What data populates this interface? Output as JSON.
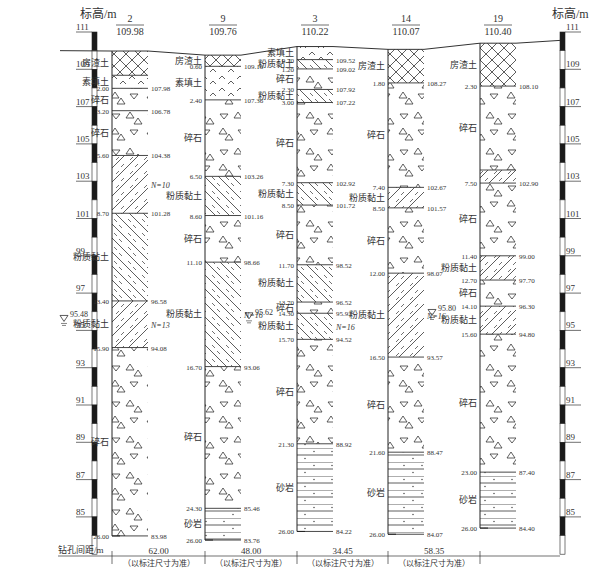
{
  "axis": {
    "title_left": "标高/m",
    "title_right": "标高/m",
    "ticks": [
      111,
      109,
      107,
      105,
      103,
      101,
      99,
      97,
      95,
      93,
      91,
      89,
      87,
      85
    ],
    "range": [
      83,
      111
    ]
  },
  "legend_colors": {
    "line": "#333333",
    "scale_dark": "#1a1a1a",
    "scale_light": "#ffffff"
  },
  "boreholes": [
    {
      "id": "2",
      "elevation": "109.98",
      "top": 109.98,
      "layers": [
        {
          "name": "房渣土",
          "pattern": "crosshatch",
          "from": 0,
          "to": 1.3
        },
        {
          "name": "素填土",
          "pattern": "fill",
          "from": 1.3,
          "to": 2.0,
          "depth_label": "2.00",
          "elev_label": "107.98"
        },
        {
          "name": "碎石",
          "pattern": "gravel",
          "from": 2.0,
          "to": 3.2,
          "depth_label": "3.20",
          "elev_label": "106.78"
        },
        {
          "name": "碎石",
          "pattern": "gravel",
          "from": 3.2,
          "to": 5.6,
          "depth_label": "5.60",
          "elev_label": "104.38"
        },
        {
          "name": "",
          "pattern": "silt-fwd",
          "from": 5.6,
          "to": 8.7,
          "depth_label": "8.70",
          "elev_label": "101.28",
          "note": "N=10"
        },
        {
          "name": "粉质黏土",
          "pattern": "silt-back",
          "from": 8.7,
          "to": 13.4,
          "depth_label": "13.40",
          "elev_label": "96.58"
        },
        {
          "name": "粉质黏土",
          "pattern": "silt-fwd",
          "from": 13.4,
          "to": 15.9,
          "depth_label": "15.90",
          "elev_label": "94.08",
          "note": "N=13"
        },
        {
          "name": "碎石",
          "pattern": "gravel",
          "from": 15.9,
          "to": 26.0,
          "depth_label": "26.00",
          "elev_label": "83.98"
        }
      ],
      "water": "95.48"
    },
    {
      "id": "9",
      "elevation": "109.76",
      "top": 109.76,
      "layers": [
        {
          "name": "房渣土",
          "pattern": "crosshatch",
          "from": 0,
          "to": 0.6,
          "depth_label": "0.60",
          "elev_label": "109.16"
        },
        {
          "name": "素填土",
          "pattern": "fill",
          "from": 0.6,
          "to": 2.4,
          "depth_label": "2.40",
          "elev_label": "107.36"
        },
        {
          "name": "碎石",
          "pattern": "gravel",
          "from": 2.4,
          "to": 6.5,
          "depth_label": "6.50",
          "elev_label": "103.26"
        },
        {
          "name": "粉质黏土",
          "pattern": "silt-back",
          "from": 6.5,
          "to": 8.6,
          "depth_label": "8.60",
          "elev_label": "101.16"
        },
        {
          "name": "碎石",
          "pattern": "gravel",
          "from": 8.6,
          "to": 11.1,
          "depth_label": "11.10",
          "elev_label": "98.66"
        },
        {
          "name": "粉质黏土",
          "pattern": "silt-back",
          "from": 11.1,
          "to": 16.7,
          "depth_label": "16.70",
          "elev_label": "93.06",
          "note": "N=16"
        },
        {
          "name": "碎石",
          "pattern": "gravel",
          "from": 16.7,
          "to": 24.3,
          "depth_label": "24.30",
          "elev_label": "85.46"
        },
        {
          "name": "砂岩",
          "pattern": "sandstone",
          "from": 24.3,
          "to": 26.0,
          "depth_label": "26.00",
          "elev_label": "83.76"
        }
      ],
      "water": "95.62"
    },
    {
      "id": "3",
      "elevation": "110.22",
      "top": 110.22,
      "layers": [
        {
          "name": "素填土",
          "pattern": "fill",
          "from": 0,
          "to": 0.7,
          "depth_label": "0.70",
          "elev_label": "109.52"
        },
        {
          "name": "粉质黏土",
          "pattern": "silt-back",
          "from": 0.7,
          "to": 1.2,
          "depth_label": "1.20",
          "elev_label": "109.02"
        },
        {
          "name": "碎石",
          "pattern": "gravel",
          "from": 1.2,
          "to": 2.3,
          "depth_label": "2.30",
          "elev_label": "107.92"
        },
        {
          "name": "粉质黏土",
          "pattern": "silt-back",
          "from": 2.3,
          "to": 3.0,
          "depth_label": "3.00",
          "elev_label": "107.22"
        },
        {
          "name": "碎石",
          "pattern": "gravel",
          "from": 3.0,
          "to": 7.3,
          "depth_label": "7.30",
          "elev_label": "102.92"
        },
        {
          "name": "粉质黏土",
          "pattern": "silt-back",
          "from": 7.3,
          "to": 8.5,
          "depth_label": "8.50",
          "elev_label": "101.72"
        },
        {
          "name": "碎石",
          "pattern": "gravel",
          "from": 8.5,
          "to": 11.7,
          "depth_label": "11.70",
          "elev_label": "98.52"
        },
        {
          "name": "粉质黏土",
          "pattern": "silt-back",
          "from": 11.7,
          "to": 13.7,
          "depth_label": "13.70",
          "elev_label": "96.52"
        },
        {
          "name": "碎石",
          "pattern": "gravel",
          "from": 13.7,
          "to": 14.3,
          "depth_label": "14.30",
          "elev_label": "95.92"
        },
        {
          "name": "粉质黏土",
          "pattern": "silt-back",
          "from": 14.3,
          "to": 15.7,
          "depth_label": "15.70",
          "elev_label": "94.52",
          "note": "N=16"
        },
        {
          "name": "碎石",
          "pattern": "gravel",
          "from": 15.7,
          "to": 21.3,
          "depth_label": "21.30",
          "elev_label": "88.92"
        },
        {
          "name": "砂岩",
          "pattern": "sandstone",
          "from": 21.3,
          "to": 26.0,
          "depth_label": "26.00",
          "elev_label": "84.22"
        }
      ],
      "water": ""
    },
    {
      "id": "14",
      "elevation": "110.07",
      "top": 110.07,
      "layers": [
        {
          "name": "房渣土",
          "pattern": "crosshatch",
          "from": 0,
          "to": 1.8,
          "depth_label": "1.80",
          "elev_label": "108.27"
        },
        {
          "name": "碎石",
          "pattern": "gravel",
          "from": 1.8,
          "to": 7.4,
          "depth_label": "7.40",
          "elev_label": "102.67"
        },
        {
          "name": "粉质黏土",
          "pattern": "silt-fwd",
          "from": 7.4,
          "to": 8.5,
          "depth_label": "8.50",
          "elev_label": "101.57"
        },
        {
          "name": "碎石",
          "pattern": "gravel",
          "from": 8.5,
          "to": 12.0,
          "depth_label": "12.00",
          "elev_label": "98.07"
        },
        {
          "name": "粉质黏土",
          "pattern": "silt-fwd",
          "from": 12.0,
          "to": 16.5,
          "depth_label": "16.50",
          "elev_label": "93.57",
          "note": "N=16"
        },
        {
          "name": "碎石",
          "pattern": "gravel",
          "from": 16.5,
          "to": 21.6,
          "depth_label": "21.60",
          "elev_label": "88.47"
        },
        {
          "name": "砂岩",
          "pattern": "sandstone",
          "from": 21.6,
          "to": 26.0,
          "depth_label": "26.00",
          "elev_label": "84.07"
        }
      ],
      "water": "95.80"
    },
    {
      "id": "19",
      "elevation": "110.40",
      "top": 110.4,
      "layers": [
        {
          "name": "房渣土",
          "pattern": "crosshatch",
          "from": 0,
          "to": 2.3,
          "depth_label": "2.30",
          "elev_label": "108.10"
        },
        {
          "name": "碎石",
          "pattern": "gravel",
          "from": 2.3,
          "to": 6.8
        },
        {
          "name": "",
          "pattern": "silt-fwd",
          "from": 6.8,
          "to": 7.5,
          "depth_label": "7.50",
          "elev_label": "102.90"
        },
        {
          "name": "碎石",
          "pattern": "gravel",
          "from": 7.5,
          "to": 11.4,
          "depth_label": "11.40",
          "elev_label": "99.00"
        },
        {
          "name": "粉质黏土",
          "pattern": "silt-fwd",
          "from": 11.4,
          "to": 12.7,
          "depth_label": "12.70",
          "elev_label": "97.70"
        },
        {
          "name": "碎石",
          "pattern": "gravel",
          "from": 12.7,
          "to": 14.1,
          "depth_label": "14.10",
          "elev_label": "96.30"
        },
        {
          "name": "粉质黏土",
          "pattern": "silt-fwd",
          "from": 14.1,
          "to": 15.6,
          "depth_label": "15.60",
          "elev_label": "94.80"
        },
        {
          "name": "碎石",
          "pattern": "gravel",
          "from": 15.6,
          "to": 23.0,
          "depth_label": "23.00",
          "elev_label": "87.40"
        },
        {
          "name": "砂岩",
          "pattern": "sandstone",
          "from": 23.0,
          "to": 26.0,
          "depth_label": "26.00",
          "elev_label": "84.40"
        }
      ],
      "water": ""
    }
  ],
  "spacing": {
    "label": "钻孔间距/m",
    "values": [
      "62.00",
      "48.00",
      "34.45",
      "58.35"
    ],
    "note": "（以标注尺寸为准）"
  }
}
